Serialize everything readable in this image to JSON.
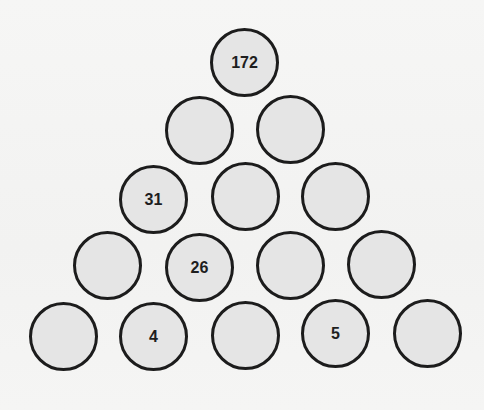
{
  "puzzle": {
    "type": "number-pyramid",
    "rows": [
      [
        "172"
      ],
      [
        "",
        ""
      ],
      [
        "31",
        "",
        ""
      ],
      [
        "",
        "26",
        "",
        ""
      ],
      [
        "",
        "4",
        "",
        "5",
        ""
      ]
    ],
    "colors": {
      "circle_fill": "#e5e5e5",
      "circle_stroke": "#1c1c1c",
      "text": "#1e1e1e",
      "background": "#f4f4f3"
    }
  }
}
